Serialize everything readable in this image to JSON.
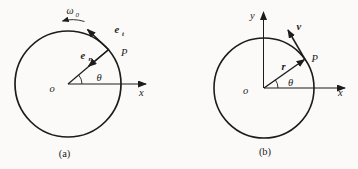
{
  "figure": {
    "background": "#fbfaf8",
    "ink": "#1c1c1c",
    "diagram_a": {
      "caption": "(a)",
      "labels": {
        "angular_velocity": "ω",
        "angular_velocity_sub": "0",
        "origin": "o",
        "x_axis": "x",
        "angle": "θ",
        "point": "P",
        "tangent_unit_vector": "e",
        "tangent_unit_vector_sub": "t",
        "normal_unit_vector": "e",
        "normal_unit_vector_sub": "n"
      }
    },
    "diagram_b": {
      "caption": "(b)",
      "labels": {
        "y_axis": "y",
        "x_axis": "x",
        "origin": "o",
        "angle": "θ",
        "point": "P",
        "radius_vector": "r",
        "velocity_vector": "v"
      }
    }
  }
}
